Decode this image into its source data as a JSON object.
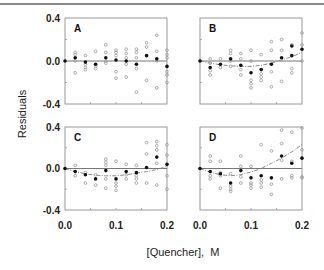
{
  "chart_data": {
    "type": "scatter",
    "title": "",
    "xlabel": "[Quencher],  M",
    "ylabel": "Residuals",
    "xlim": [
      0.0,
      0.2
    ],
    "ylim": [
      -0.4,
      0.4
    ],
    "x_ticks": [
      "0.0",
      "0.1",
      "0.2"
    ],
    "y_ticks": [
      "0.4",
      "0.0",
      "-0.4"
    ],
    "grid": false,
    "legend": null,
    "panels": [
      {
        "label": "A",
        "fit_curve": null,
        "mean_points": [
          [
            0.0,
            0.0
          ],
          [
            0.02,
            0.03
          ],
          [
            0.04,
            -0.01
          ],
          [
            0.06,
            -0.03
          ],
          [
            0.08,
            0.03
          ],
          [
            0.1,
            0.01
          ],
          [
            0.12,
            0.0
          ],
          [
            0.14,
            -0.03
          ],
          [
            0.16,
            0.05
          ],
          [
            0.18,
            0.02
          ],
          [
            0.2,
            -0.05
          ]
        ],
        "raw_points": [
          [
            0.02,
            0.08
          ],
          [
            0.02,
            0.06
          ],
          [
            0.02,
            0.0
          ],
          [
            0.02,
            -0.11
          ],
          [
            0.04,
            0.05
          ],
          [
            0.04,
            -0.03
          ],
          [
            0.04,
            -0.06
          ],
          [
            0.04,
            -0.08
          ],
          [
            0.06,
            0.09
          ],
          [
            0.06,
            -0.05
          ],
          [
            0.06,
            -0.07
          ],
          [
            0.08,
            0.15
          ],
          [
            0.08,
            0.08
          ],
          [
            0.08,
            0.0
          ],
          [
            0.08,
            -0.02
          ],
          [
            0.1,
            0.1
          ],
          [
            0.1,
            0.08
          ],
          [
            0.1,
            0.05
          ],
          [
            0.1,
            -0.1
          ],
          [
            0.1,
            -0.16
          ],
          [
            0.12,
            0.11
          ],
          [
            0.12,
            0.07
          ],
          [
            0.12,
            0.03
          ],
          [
            0.12,
            -0.03
          ],
          [
            0.12,
            -0.15
          ],
          [
            0.14,
            0.11
          ],
          [
            0.14,
            0.08
          ],
          [
            0.14,
            0.03
          ],
          [
            0.14,
            -0.07
          ],
          [
            0.14,
            -0.29
          ],
          [
            0.16,
            0.17
          ],
          [
            0.16,
            0.13
          ],
          [
            0.16,
            -0.18
          ],
          [
            0.18,
            0.24
          ],
          [
            0.18,
            0.09
          ],
          [
            0.18,
            0.0
          ],
          [
            0.18,
            -0.25
          ],
          [
            0.2,
            0.1
          ],
          [
            0.2,
            0.06
          ],
          [
            0.2,
            0.03
          ],
          [
            0.2,
            -0.1
          ],
          [
            0.2,
            -0.13
          ],
          [
            0.2,
            -0.2
          ]
        ]
      },
      {
        "label": "B",
        "fit_curve": [
          [
            0.0,
            0.0
          ],
          [
            0.02,
            -0.02
          ],
          [
            0.04,
            -0.035
          ],
          [
            0.06,
            -0.045
          ],
          [
            0.08,
            -0.05
          ],
          [
            0.1,
            -0.05
          ],
          [
            0.12,
            -0.04
          ],
          [
            0.14,
            -0.02
          ],
          [
            0.16,
            0.01
          ],
          [
            0.18,
            0.04
          ],
          [
            0.2,
            0.08
          ]
        ],
        "mean_points": [
          [
            0.0,
            0.0
          ],
          [
            0.02,
            -0.06
          ],
          [
            0.04,
            -0.03
          ],
          [
            0.06,
            0.02
          ],
          [
            0.08,
            -0.04
          ],
          [
            0.1,
            -0.11
          ],
          [
            0.12,
            -0.08
          ],
          [
            0.14,
            -0.03
          ],
          [
            0.16,
            0.03
          ],
          [
            0.18,
            0.14
          ],
          [
            0.18,
            0.05
          ],
          [
            0.2,
            0.11
          ]
        ],
        "raw_points": [
          [
            0.02,
            0.02
          ],
          [
            0.02,
            -0.02
          ],
          [
            0.02,
            -0.09
          ],
          [
            0.02,
            -0.13
          ],
          [
            0.04,
            0.02
          ],
          [
            0.04,
            -0.06
          ],
          [
            0.06,
            0.1
          ],
          [
            0.06,
            0.07
          ],
          [
            0.06,
            0.0
          ],
          [
            0.06,
            -0.05
          ],
          [
            0.08,
            0.07
          ],
          [
            0.08,
            0.02
          ],
          [
            0.08,
            -0.08
          ],
          [
            0.08,
            -0.13
          ],
          [
            0.1,
            0.1
          ],
          [
            0.1,
            0.0
          ],
          [
            0.1,
            -0.18
          ],
          [
            0.1,
            -0.21
          ],
          [
            0.1,
            -0.25
          ],
          [
            0.12,
            0.06
          ],
          [
            0.12,
            -0.12
          ],
          [
            0.12,
            -0.15
          ],
          [
            0.12,
            -0.18
          ],
          [
            0.14,
            0.18
          ],
          [
            0.14,
            0.1
          ],
          [
            0.14,
            -0.1
          ],
          [
            0.14,
            -0.24
          ],
          [
            0.16,
            0.2
          ],
          [
            0.16,
            0.1
          ],
          [
            0.16,
            -0.19
          ],
          [
            0.18,
            0.15
          ],
          [
            0.18,
            -0.07
          ],
          [
            0.18,
            -0.11
          ],
          [
            0.2,
            0.26
          ],
          [
            0.2,
            0.15
          ],
          [
            0.2,
            0.0
          ]
        ]
      },
      {
        "label": "C",
        "fit_curve": [
          [
            0.0,
            0.0
          ],
          [
            0.02,
            -0.03
          ],
          [
            0.04,
            -0.05
          ],
          [
            0.06,
            -0.065
          ],
          [
            0.08,
            -0.07
          ],
          [
            0.1,
            -0.07
          ],
          [
            0.12,
            -0.06
          ],
          [
            0.14,
            -0.045
          ],
          [
            0.16,
            -0.03
          ],
          [
            0.18,
            -0.01
          ],
          [
            0.2,
            0.02
          ]
        ],
        "mean_points": [
          [
            0.0,
            0.0
          ],
          [
            0.02,
            -0.03
          ],
          [
            0.04,
            -0.06
          ],
          [
            0.06,
            -0.1
          ],
          [
            0.08,
            -0.02
          ],
          [
            0.1,
            -0.1
          ],
          [
            0.12,
            -0.03
          ],
          [
            0.14,
            -0.04
          ],
          [
            0.16,
            0.01
          ],
          [
            0.18,
            0.11
          ],
          [
            0.2,
            0.04
          ]
        ],
        "raw_points": [
          [
            0.02,
            0.03
          ],
          [
            0.02,
            -0.07
          ],
          [
            0.04,
            -0.04
          ],
          [
            0.04,
            -0.14
          ],
          [
            0.06,
            -0.06
          ],
          [
            0.06,
            -0.16
          ],
          [
            0.08,
            0.09
          ],
          [
            0.08,
            0.06
          ],
          [
            0.08,
            0.03
          ],
          [
            0.08,
            -0.1
          ],
          [
            0.08,
            -0.19
          ],
          [
            0.1,
            0.07
          ],
          [
            0.1,
            -0.14
          ],
          [
            0.1,
            -0.17
          ],
          [
            0.1,
            -0.21
          ],
          [
            0.12,
            0.04
          ],
          [
            0.12,
            -0.06
          ],
          [
            0.12,
            -0.1
          ],
          [
            0.14,
            0.03
          ],
          [
            0.14,
            -0.07
          ],
          [
            0.14,
            -0.1
          ],
          [
            0.14,
            -0.14
          ],
          [
            0.16,
            0.25
          ],
          [
            0.16,
            0.14
          ],
          [
            0.16,
            -0.14
          ],
          [
            0.18,
            0.26
          ],
          [
            0.18,
            0.22
          ],
          [
            0.18,
            0.18
          ],
          [
            0.18,
            0.05
          ],
          [
            0.18,
            -0.16
          ],
          [
            0.2,
            0.23
          ],
          [
            0.2,
            0.13
          ],
          [
            0.2,
            -0.07
          ],
          [
            0.2,
            -0.2
          ]
        ]
      },
      {
        "label": "D",
        "fit_curve": [
          [
            0.0,
            0.0
          ],
          [
            0.02,
            -0.035
          ],
          [
            0.04,
            -0.06
          ],
          [
            0.06,
            -0.07
          ],
          [
            0.08,
            -0.06
          ],
          [
            0.1,
            -0.035
          ],
          [
            0.12,
            0.0
          ],
          [
            0.14,
            0.05
          ],
          [
            0.16,
            0.1
          ],
          [
            0.18,
            0.16
          ],
          [
            0.2,
            0.23
          ]
        ],
        "mean_points": [
          [
            0.0,
            0.0
          ],
          [
            0.02,
            -0.03
          ],
          [
            0.04,
            -0.05
          ],
          [
            0.06,
            -0.14
          ],
          [
            0.08,
            -0.02
          ],
          [
            0.1,
            -0.09
          ],
          [
            0.12,
            -0.07
          ],
          [
            0.14,
            -0.09
          ],
          [
            0.16,
            0.12
          ],
          [
            0.18,
            0.05
          ],
          [
            0.2,
            0.1
          ]
        ],
        "raw_points": [
          [
            0.02,
            0.12
          ],
          [
            0.02,
            0.07
          ],
          [
            0.02,
            -0.07
          ],
          [
            0.02,
            -0.1
          ],
          [
            0.04,
            0.07
          ],
          [
            0.04,
            -0.04
          ],
          [
            0.04,
            -0.07
          ],
          [
            0.04,
            -0.19
          ],
          [
            0.06,
            -0.05
          ],
          [
            0.06,
            -0.17
          ],
          [
            0.06,
            -0.2
          ],
          [
            0.06,
            -0.22
          ],
          [
            0.08,
            0.12
          ],
          [
            0.08,
            0.02
          ],
          [
            0.08,
            -0.08
          ],
          [
            0.08,
            -0.14
          ],
          [
            0.1,
            0.02
          ],
          [
            0.1,
            -0.14
          ],
          [
            0.1,
            -0.16
          ],
          [
            0.1,
            -0.19
          ],
          [
            0.12,
            0.23
          ],
          [
            0.12,
            -0.11
          ],
          [
            0.12,
            -0.14
          ],
          [
            0.12,
            -0.18
          ],
          [
            0.14,
            0.17
          ],
          [
            0.14,
            -0.15
          ],
          [
            0.14,
            -0.25
          ],
          [
            0.16,
            0.37
          ],
          [
            0.16,
            0.24
          ],
          [
            0.16,
            0.08
          ],
          [
            0.16,
            -0.1
          ],
          [
            0.18,
            0.35
          ],
          [
            0.18,
            0.07
          ],
          [
            0.18,
            -0.07
          ],
          [
            0.18,
            -0.09
          ],
          [
            0.2,
            0.39
          ],
          [
            0.2,
            0.18
          ],
          [
            0.2,
            -0.08
          ],
          [
            0.2,
            -0.09
          ]
        ]
      }
    ]
  },
  "layout": {
    "panels": [
      {
        "x0": 65,
        "y0": 18,
        "x1": 167,
        "y1": 104
      },
      {
        "x0": 200,
        "y0": 18,
        "x1": 302,
        "y1": 104
      },
      {
        "x0": 65,
        "y0": 127,
        "x1": 167,
        "y1": 210
      },
      {
        "x0": 200,
        "y0": 127,
        "x1": 302,
        "y1": 210
      }
    ]
  },
  "colors": {
    "frame": "#9a9a9a",
    "zero_line": "#777777",
    "mean_point": "#111111",
    "raw_point": "#9a9a9a",
    "fit_curve": "#8a8a8a",
    "top_rule": "#8a8a8a"
  }
}
